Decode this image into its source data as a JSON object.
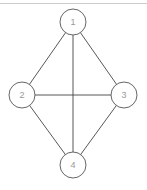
{
  "diagram": {
    "type": "graph",
    "nodes": [
      {
        "id": "1",
        "label": "1",
        "cx": 73,
        "cy": 22
      },
      {
        "id": "2",
        "label": "2",
        "cx": 22,
        "cy": 95
      },
      {
        "id": "3",
        "label": "3",
        "cx": 124,
        "cy": 95
      },
      {
        "id": "4",
        "label": "4",
        "cx": 73,
        "cy": 165
      }
    ],
    "edges": [
      [
        "1",
        "2"
      ],
      [
        "1",
        "3"
      ],
      [
        "1",
        "4"
      ],
      [
        "2",
        "3"
      ],
      [
        "2",
        "4"
      ],
      [
        "3",
        "4"
      ]
    ],
    "colors": {
      "stroke": "#555555",
      "edge": "#444444",
      "label": "#999999",
      "top_border": "#cccccc"
    }
  }
}
